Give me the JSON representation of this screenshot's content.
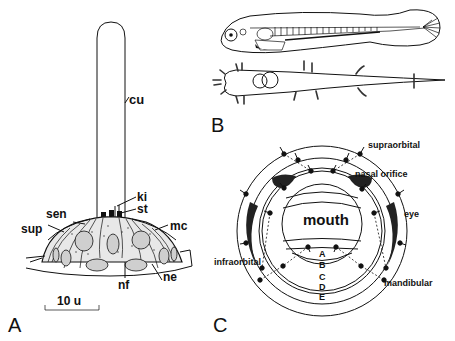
{
  "figure": {
    "panels": [
      {
        "id": "A",
        "label": "A",
        "description": "Cross-section of a neuromast with cupula",
        "labels": {
          "cu": "cu",
          "ki": "ki",
          "st": "st",
          "sen": "sen",
          "sup": "sup",
          "mc": "mc",
          "nf": "nf",
          "ne": "ne"
        },
        "scale_bar": "10 u"
      },
      {
        "id": "B",
        "label": "B",
        "description": "Larval fish in lateral and dorsal views showing neuromasts"
      },
      {
        "id": "C",
        "label": "C",
        "description": "Schematic of cephalic lateral line canals around the mouth",
        "labels": {
          "supraorbital": "supraorbital",
          "nasal_orifice": "nasal orifice",
          "eye": "eye",
          "mouth": "mouth",
          "infraorbital": "infraorbital",
          "mandibular": "mandibular"
        },
        "rings": [
          "A",
          "B",
          "C",
          "D",
          "E"
        ]
      }
    ]
  }
}
